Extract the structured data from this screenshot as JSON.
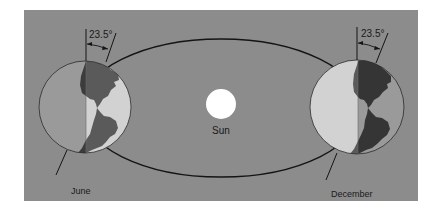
{
  "diagram": {
    "type": "earth-orbit-seasons",
    "colors": {
      "background": "#8c8c8c",
      "orbit": "#141414",
      "sun": "#ffffff",
      "globe_day": "#d2d2d2",
      "globe_night": "#9a9a9a",
      "land_day": "#5a5a5a",
      "land_night": "#353535",
      "text": "#1a1a1a"
    },
    "sun": {
      "label": "Sun"
    },
    "positions": [
      {
        "id": "june",
        "label": "June",
        "tilt_label": "23.5°",
        "lit_side": "right"
      },
      {
        "id": "december",
        "label": "December",
        "tilt_label": "23.5°",
        "lit_side": "left"
      }
    ]
  }
}
